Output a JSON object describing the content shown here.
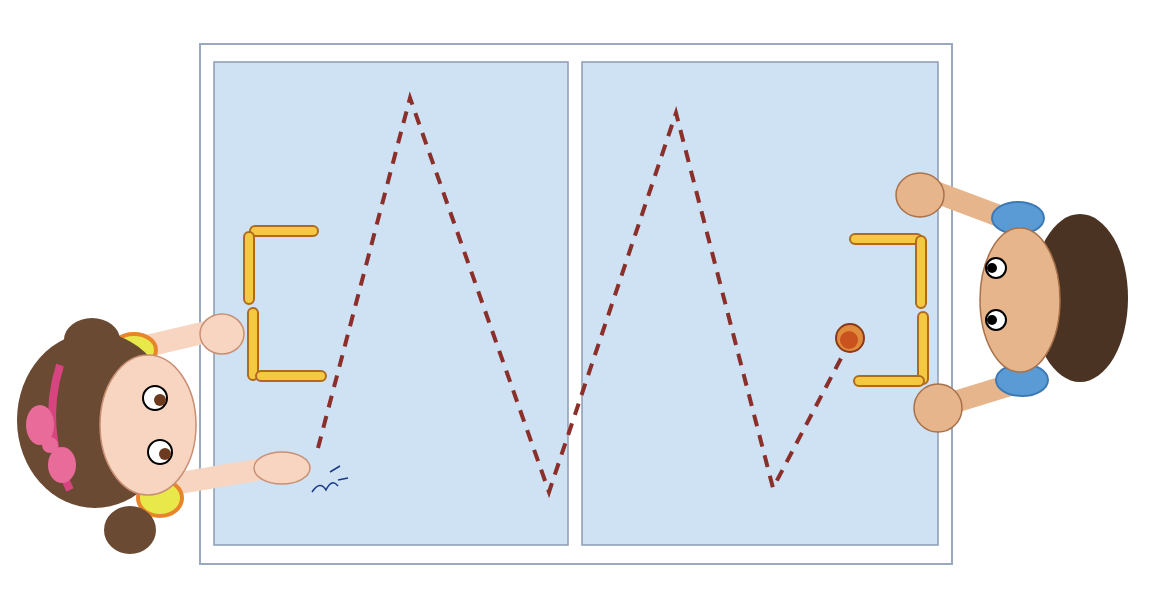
{
  "scene": {
    "description": "Two children playing a finger-flick table game with a puck and matchstick goals",
    "colors": {
      "table_border": "#9aa8c0",
      "table_white": "#ffffff",
      "field": "#cfe2f3",
      "path": "#8b2f2a",
      "stick_fill": "#f5c842",
      "stick_edge": "#b06a1c",
      "puck": "#c9521f",
      "skin": "#f8d5c0",
      "boy_skin": "#e6b58c",
      "girl_hair": "#6b4a33",
      "boy_hair": "#4a3322",
      "girl_sleeve": "#e8e84a",
      "boy_sleeve": "#5b9bd5",
      "bow": "#e86b9a"
    }
  }
}
